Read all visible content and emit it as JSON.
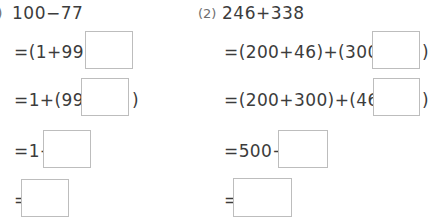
{
  "page": {
    "background_color": "#ffffff",
    "text_color": "#3c3c3c",
    "box_border_color": "#bdbdbd",
    "label_color": "#6e6e6e"
  },
  "problems": [
    {
      "id": "problem-1",
      "label": ")",
      "title": "100−77",
      "steps": [
        {
          "id": "step-1",
          "prefix": "=(1+99)−",
          "suffix": "",
          "has_box": true
        },
        {
          "id": "step-2",
          "prefix": "=1+(99−",
          "suffix": ")",
          "has_box": true
        },
        {
          "id": "step-3",
          "prefix": "=1+",
          "suffix": "",
          "has_box": true
        },
        {
          "id": "step-4",
          "prefix": "=",
          "suffix": "",
          "has_box": true
        }
      ]
    },
    {
      "id": "problem-2",
      "label": "(2)",
      "title": "246+338",
      "steps": [
        {
          "id": "step-1",
          "prefix": "=(200+46)+(300+",
          "suffix": ")",
          "has_box": true
        },
        {
          "id": "step-2",
          "prefix": "=(200+300)+(46+",
          "suffix": ")",
          "has_box": true
        },
        {
          "id": "step-3",
          "prefix": "=500+",
          "suffix": "",
          "has_box": true
        },
        {
          "id": "step-4",
          "prefix": "=",
          "suffix": "",
          "has_box": true
        }
      ]
    }
  ]
}
